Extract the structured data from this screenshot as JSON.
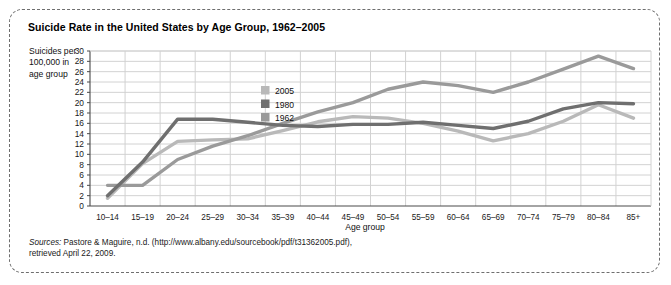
{
  "figure": {
    "title": "Suicide Rate in the United States by Age Group, 1962–2005",
    "y_axis_caption": "Suicides per 100,000 in age group",
    "source_prefix": "Sources:",
    "source_line1": " Pastore & Maguire, n.d. (http://www.albany.edu/sourcebook/pdf/t31362005.pdf),",
    "source_line2": "retrieved April 22, 2009."
  },
  "colors": {
    "series_2005": "#b9b9b9",
    "series_1980": "#6f6f6f",
    "series_1962": "#9a9a9a",
    "grid": "#d2d2d2",
    "axis": "#4a4a4a",
    "frame": "#6e6e6e",
    "text": "#1a1a1a"
  },
  "chart_data": {
    "type": "line",
    "title": "Suicide Rate in the United States by Age Group, 1962–2005",
    "xlabel": "Age group",
    "ylabel": "Suicides per 100,000 in age group",
    "ylim": [
      0,
      30
    ],
    "ytick_step": 2,
    "yticks": [
      0,
      2,
      4,
      6,
      8,
      10,
      12,
      14,
      16,
      18,
      20,
      22,
      24,
      26,
      28,
      30
    ],
    "grid": true,
    "legend_position": "upper-center-left",
    "categories": [
      "10–14",
      "15–19",
      "20–24",
      "25–29",
      "30–34",
      "35–39",
      "40–44",
      "45–49",
      "50–54",
      "55–59",
      "60–64",
      "65–69",
      "70–74",
      "75–79",
      "80–84",
      "85+"
    ],
    "series": [
      {
        "name": "2005",
        "color": "#b9b9b9",
        "values": [
          1.5,
          8.2,
          12.5,
          12.8,
          13.0,
          14.6,
          16.3,
          17.3,
          17.0,
          16.0,
          14.5,
          12.6,
          14.0,
          16.4,
          19.6,
          17.0
        ]
      },
      {
        "name": "1980",
        "color": "#6f6f6f",
        "values": [
          2.0,
          8.5,
          16.8,
          16.8,
          16.2,
          15.6,
          15.4,
          15.8,
          15.8,
          16.2,
          15.6,
          15.0,
          16.4,
          18.8,
          20.0,
          19.8
        ]
      },
      {
        "name": "1962",
        "color": "#9a9a9a",
        "values": [
          4.0,
          4.0,
          9.0,
          11.6,
          13.6,
          16.0,
          18.2,
          20.0,
          22.6,
          24.0,
          23.3,
          22.0,
          24.0,
          26.5,
          29.0,
          26.6
        ]
      }
    ],
    "legend": [
      {
        "label": "2005",
        "color": "#b9b9b9"
      },
      {
        "label": "1980",
        "color": "#6f6f6f"
      },
      {
        "label": "1962",
        "color": "#9a9a9a"
      }
    ]
  }
}
